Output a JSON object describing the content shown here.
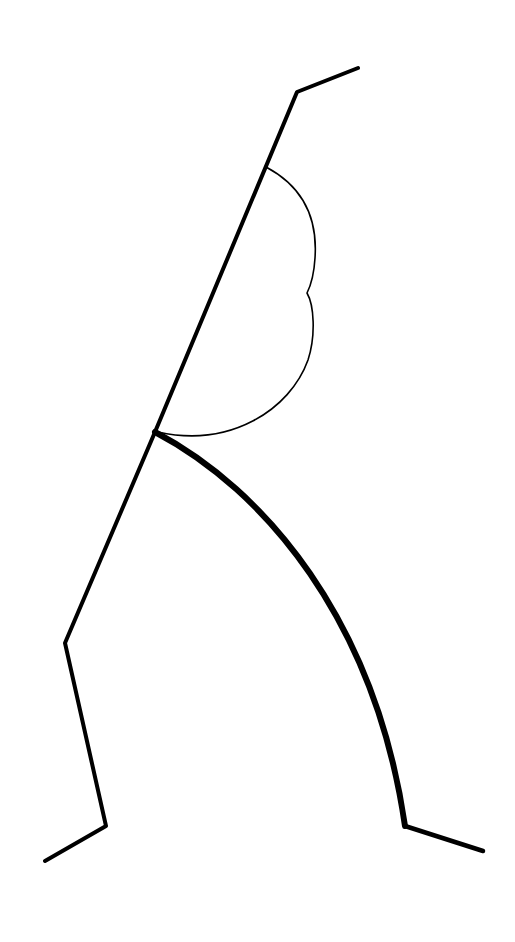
{
  "canvas": {
    "width": 515,
    "height": 942,
    "background": "#ffffff"
  },
  "stroke_color": "#000000",
  "shapes": {
    "main_polyline": {
      "d": "M358,68 L297,92 L155,432 L65,643 L106,826 L45,861",
      "width": 4
    },
    "cloud_curve": {
      "d": "M266,167 C300,185 318,215 315,258 C314,275 311,285 307,293 C314,305 316,335 308,360 C290,410 230,448 158,432",
      "width": 1.6
    },
    "thick_arc": {
      "d": "M155,432 C265,490 375,620 405,826",
      "width": 6
    },
    "right_foot": {
      "d": "M405,826 L483,851",
      "width": 4.5
    }
  }
}
